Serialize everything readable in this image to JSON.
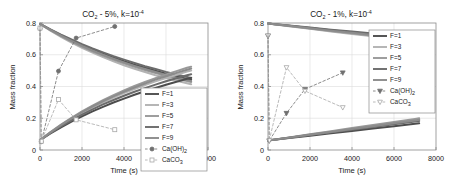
{
  "figure": {
    "background": "#ffffff",
    "axis_color": "#808080",
    "grid_color": "#d9d9d9",
    "text_color": "#1a1a1a"
  },
  "axis": {
    "xlabel": "Time (s)",
    "ylabel": "Mass fraction",
    "xticks": [
      "0",
      "2000",
      "4000",
      "6000",
      "8000"
    ],
    "yticks": [
      "0",
      "0.2",
      "0.4",
      "0.6",
      "0.8"
    ],
    "xlim": [
      0,
      8000
    ],
    "ylim": [
      0,
      0.8
    ]
  },
  "legend": {
    "entries": [
      {
        "label": "F=1",
        "color": "#4d4d4d",
        "style": "solid",
        "marker": "none"
      },
      {
        "label": "F=3",
        "color": "#b3b3b3",
        "style": "solid",
        "marker": "none"
      },
      {
        "label": "F=5",
        "color": "#999999",
        "style": "solid",
        "marker": "none"
      },
      {
        "label": "F=7",
        "color": "#6b6b6b",
        "style": "solid",
        "marker": "none"
      },
      {
        "label": "F=9",
        "color": "#8c8c8c",
        "style": "solid",
        "marker": "none"
      }
    ],
    "marker_entries_left": [
      {
        "label_main": "Ca(OH)",
        "label_sub": "2",
        "color": "#707070",
        "style": "dashed",
        "marker": "circle-filled"
      },
      {
        "label_main": "CaCO",
        "label_sub": "3",
        "color": "#a8a8a8",
        "style": "dashed",
        "marker": "square-open"
      }
    ],
    "marker_entries_right": [
      {
        "label_main": "Ca(OH)",
        "label_sub": "2",
        "color": "#707070",
        "style": "dashed",
        "marker": "triangle-down-filled"
      },
      {
        "label_main": "CaCO",
        "label_sub": "3",
        "color": "#a8a8a8",
        "style": "dashed",
        "marker": "triangle-down-open"
      }
    ]
  },
  "chart_data": [
    {
      "type": "line",
      "panel": "left",
      "title_main": "CO",
      "title_sub": "2",
      "title_mid": " - 5%, k=10",
      "title_sup": "-4",
      "title": "CO2 - 5%, k=10^-4",
      "xlabel": "Time (s)",
      "ylabel": "Mass fraction",
      "xlim": [
        0,
        8000
      ],
      "ylim": [
        0,
        0.8
      ],
      "xticks": [
        0,
        2000,
        4000,
        6000,
        8000
      ],
      "yticks": [
        0,
        0.2,
        0.4,
        0.6,
        0.8
      ],
      "grid": true,
      "legend_position": "center-right",
      "series": [
        {
          "name": "F=1",
          "color": "#4d4d4d",
          "style": "solid",
          "x": [
            0,
            500,
            1000,
            1500,
            2000,
            2500,
            3000,
            3500,
            4000,
            4500,
            5000,
            5500,
            6000,
            6500,
            7000,
            7200
          ],
          "y": [
            0.795,
            0.757,
            0.722,
            0.69,
            0.66,
            0.632,
            0.606,
            0.582,
            0.559,
            0.538,
            0.518,
            0.499,
            0.481,
            0.464,
            0.448,
            0.442
          ]
        },
        {
          "name": "F=3",
          "color": "#b3b3b3",
          "style": "solid",
          "x": [
            0,
            500,
            1000,
            1500,
            2000,
            2500,
            3000,
            3500,
            4000,
            4500,
            5000,
            5500,
            6000,
            6500,
            7000,
            7200
          ],
          "y": [
            0.795,
            0.752,
            0.713,
            0.677,
            0.644,
            0.613,
            0.585,
            0.559,
            0.534,
            0.512,
            0.491,
            0.471,
            0.453,
            0.436,
            0.42,
            0.414
          ]
        },
        {
          "name": "F=5",
          "color": "#999999",
          "style": "solid",
          "x": [
            0,
            500,
            1000,
            1500,
            2000,
            2500,
            3000,
            3500,
            4000,
            4500,
            5000,
            5500,
            6000,
            6500,
            7000,
            7200
          ],
          "y": [
            0.795,
            0.754,
            0.717,
            0.683,
            0.652,
            0.622,
            0.595,
            0.57,
            0.546,
            0.524,
            0.504,
            0.485,
            0.467,
            0.45,
            0.434,
            0.428
          ]
        },
        {
          "name": "F=7",
          "color": "#6b6b6b",
          "style": "solid",
          "x": [
            0,
            500,
            1000,
            1500,
            2000,
            2500,
            3000,
            3500,
            4000,
            4500,
            5000,
            5500,
            6000,
            6500,
            7000,
            7200
          ],
          "y": [
            0.795,
            0.76,
            0.727,
            0.696,
            0.667,
            0.64,
            0.615,
            0.591,
            0.569,
            0.548,
            0.528,
            0.51,
            0.492,
            0.476,
            0.46,
            0.454
          ]
        },
        {
          "name": "F=9",
          "color": "#8c8c8c",
          "style": "solid",
          "x": [
            0,
            500,
            1000,
            1500,
            2000,
            2500,
            3000,
            3500,
            4000,
            4500,
            5000,
            5500,
            6000,
            6500,
            7000,
            7200
          ],
          "y": [
            0.795,
            0.756,
            0.72,
            0.687,
            0.656,
            0.627,
            0.6,
            0.575,
            0.552,
            0.53,
            0.51,
            0.491,
            0.473,
            0.456,
            0.44,
            0.434
          ]
        },
        {
          "name": "F=1-rising",
          "color": "#4d4d4d",
          "style": "solid",
          "x": [
            0,
            500,
            1000,
            1500,
            2000,
            2500,
            3000,
            3500,
            4000,
            4500,
            5000,
            5500,
            6000,
            6500,
            7000,
            7200
          ],
          "y": [
            0.062,
            0.104,
            0.143,
            0.179,
            0.212,
            0.243,
            0.272,
            0.299,
            0.324,
            0.348,
            0.37,
            0.391,
            0.411,
            0.43,
            0.448,
            0.455
          ]
        },
        {
          "name": "F=3-rising",
          "color": "#b3b3b3",
          "style": "solid",
          "x": [
            0,
            500,
            1000,
            1500,
            2000,
            2500,
            3000,
            3500,
            4000,
            4500,
            5000,
            5500,
            6000,
            6500,
            7000,
            7200
          ],
          "y": [
            0.062,
            0.11,
            0.154,
            0.195,
            0.233,
            0.268,
            0.3,
            0.33,
            0.358,
            0.384,
            0.409,
            0.432,
            0.454,
            0.474,
            0.494,
            0.501
          ]
        },
        {
          "name": "F=5-rising",
          "color": "#999999",
          "style": "solid",
          "x": [
            0,
            500,
            1000,
            1500,
            2000,
            2500,
            3000,
            3500,
            4000,
            4500,
            5000,
            5500,
            6000,
            6500,
            7000,
            7200
          ],
          "y": [
            0.062,
            0.113,
            0.16,
            0.203,
            0.243,
            0.28,
            0.314,
            0.346,
            0.375,
            0.403,
            0.429,
            0.453,
            0.476,
            0.497,
            0.518,
            0.525
          ]
        },
        {
          "name": "F=7-rising",
          "color": "#6b6b6b",
          "style": "solid",
          "x": [
            0,
            500,
            1000,
            1500,
            2000,
            2500,
            3000,
            3500,
            4000,
            4500,
            5000,
            5500,
            6000,
            6500,
            7000,
            7200
          ],
          "y": [
            0.062,
            0.107,
            0.149,
            0.187,
            0.223,
            0.256,
            0.287,
            0.315,
            0.342,
            0.367,
            0.39,
            0.412,
            0.433,
            0.452,
            0.471,
            0.477
          ]
        },
        {
          "name": "F=9-rising",
          "color": "#8c8c8c",
          "style": "solid",
          "x": [
            0,
            500,
            1000,
            1500,
            2000,
            2500,
            3000,
            3500,
            4000,
            4500,
            5000,
            5500,
            6000,
            6500,
            7000,
            7200
          ],
          "y": [
            0.062,
            0.111,
            0.157,
            0.199,
            0.238,
            0.274,
            0.307,
            0.338,
            0.367,
            0.394,
            0.419,
            0.443,
            0.465,
            0.486,
            0.506,
            0.513
          ]
        },
        {
          "name": "Ca(OH)2",
          "color": "#707070",
          "style": "dashed",
          "marker": "circle-filled",
          "x": [
            0,
            60,
            880,
            1720,
            3560
          ],
          "y": [
            0.765,
            0.052,
            0.497,
            0.705,
            0.778
          ]
        },
        {
          "name": "CaCO3",
          "color": "#a8a8a8",
          "style": "dashed",
          "marker": "square-open",
          "x": [
            0,
            60,
            880,
            1720,
            3560
          ],
          "y": [
            0.768,
            0.055,
            0.318,
            0.19,
            0.128
          ]
        }
      ]
    },
    {
      "type": "line",
      "panel": "right",
      "title_main": "CO",
      "title_sub": "2",
      "title_mid": " - 1%, k=10",
      "title_sup": "-4",
      "title": "CO2 - 1%, k=10^-4",
      "xlabel": "Time (s)",
      "ylabel": "Mass fraction",
      "xlim": [
        0,
        8000
      ],
      "ylim": [
        0,
        0.8
      ],
      "xticks": [
        0,
        2000,
        4000,
        6000,
        8000
      ],
      "yticks": [
        0,
        0.2,
        0.4,
        0.6,
        0.8
      ],
      "grid": true,
      "legend_position": "top-right",
      "series": [
        {
          "name": "F=1",
          "color": "#4d4d4d",
          "style": "solid",
          "x": [
            0,
            1000,
            2000,
            3000,
            4000,
            5000,
            6000,
            7000,
            7200
          ],
          "y": [
            0.797,
            0.783,
            0.769,
            0.755,
            0.742,
            0.729,
            0.717,
            0.705,
            0.702
          ]
        },
        {
          "name": "F=3",
          "color": "#b3b3b3",
          "style": "solid",
          "x": [
            0,
            1000,
            2000,
            3000,
            4000,
            5000,
            6000,
            7000,
            7200
          ],
          "y": [
            0.797,
            0.78,
            0.763,
            0.747,
            0.731,
            0.716,
            0.701,
            0.687,
            0.684
          ]
        },
        {
          "name": "F=5",
          "color": "#999999",
          "style": "solid",
          "x": [
            0,
            1000,
            2000,
            3000,
            4000,
            5000,
            6000,
            7000,
            7200
          ],
          "y": [
            0.797,
            0.781,
            0.765,
            0.75,
            0.735,
            0.72,
            0.706,
            0.693,
            0.69
          ]
        },
        {
          "name": "F=7",
          "color": "#6b6b6b",
          "style": "solid",
          "x": [
            0,
            1000,
            2000,
            3000,
            4000,
            5000,
            6000,
            7000,
            7200
          ],
          "y": [
            0.797,
            0.784,
            0.771,
            0.758,
            0.746,
            0.734,
            0.722,
            0.711,
            0.709
          ]
        },
        {
          "name": "F=9",
          "color": "#8c8c8c",
          "style": "solid",
          "x": [
            0,
            1000,
            2000,
            3000,
            4000,
            5000,
            6000,
            7000,
            7200
          ],
          "y": [
            0.797,
            0.782,
            0.767,
            0.752,
            0.738,
            0.724,
            0.711,
            0.698,
            0.695
          ]
        },
        {
          "name": "F=1-rising",
          "color": "#4d4d4d",
          "style": "solid",
          "x": [
            0,
            1000,
            2000,
            3000,
            4000,
            5000,
            6000,
            7000,
            7200
          ],
          "y": [
            0.06,
            0.075,
            0.09,
            0.105,
            0.12,
            0.135,
            0.15,
            0.165,
            0.168
          ]
        },
        {
          "name": "F=3-rising",
          "color": "#b3b3b3",
          "style": "solid",
          "x": [
            0,
            1000,
            2000,
            3000,
            4000,
            5000,
            6000,
            7000,
            7200
          ],
          "y": [
            0.06,
            0.078,
            0.097,
            0.115,
            0.134,
            0.152,
            0.171,
            0.189,
            0.193
          ]
        },
        {
          "name": "F=5-rising",
          "color": "#999999",
          "style": "solid",
          "x": [
            0,
            1000,
            2000,
            3000,
            4000,
            5000,
            6000,
            7000,
            7200
          ],
          "y": [
            0.06,
            0.079,
            0.099,
            0.118,
            0.138,
            0.157,
            0.177,
            0.196,
            0.2
          ]
        },
        {
          "name": "F=7-rising",
          "color": "#6b6b6b",
          "style": "solid",
          "x": [
            0,
            1000,
            2000,
            3000,
            4000,
            5000,
            6000,
            7000,
            7200
          ],
          "y": [
            0.06,
            0.077,
            0.094,
            0.111,
            0.128,
            0.145,
            0.162,
            0.179,
            0.183
          ]
        },
        {
          "name": "F=9-rising",
          "color": "#8c8c8c",
          "style": "solid",
          "x": [
            0,
            1000,
            2000,
            3000,
            4000,
            5000,
            6000,
            7000,
            7200
          ],
          "y": [
            0.06,
            0.078,
            0.096,
            0.114,
            0.132,
            0.15,
            0.168,
            0.186,
            0.19
          ]
        },
        {
          "name": "Ca(OH)2",
          "color": "#707070",
          "style": "dashed",
          "marker": "triangle-down-filled",
          "x": [
            0,
            60,
            880,
            1760,
            3560
          ],
          "y": [
            0.718,
            0.058,
            0.232,
            0.383,
            0.487
          ]
        },
        {
          "name": "CaCO3",
          "color": "#a8a8a8",
          "style": "dashed",
          "marker": "triangle-down-open",
          "x": [
            0,
            60,
            880,
            1760,
            3560
          ],
          "y": [
            0.722,
            0.06,
            0.52,
            0.372,
            0.268
          ]
        }
      ]
    }
  ]
}
